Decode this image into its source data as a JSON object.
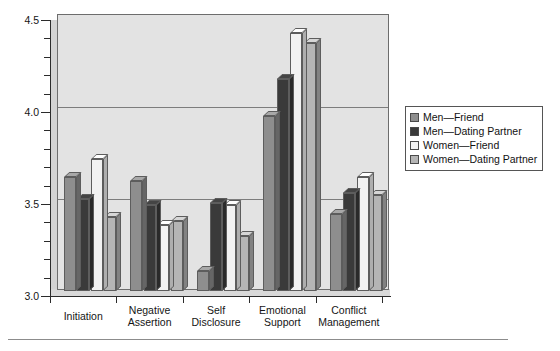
{
  "chart_data": {
    "type": "bar",
    "title": "",
    "subtitle": "",
    "xlabel": "",
    "ylabel": "",
    "ylim": [
      3.0,
      4.5
    ],
    "yticks": [
      "3.0",
      "3.5",
      "4.0",
      "4.5"
    ],
    "ytick_values": [
      3.0,
      3.5,
      4.0,
      4.5
    ],
    "minor_tick_step": 0.1,
    "grid": true,
    "gridlines_at": [
      3.5,
      4.0
    ],
    "legend_position": "right",
    "three_d": true,
    "categories": [
      "Initiation",
      "Negative Assertion",
      "Self Disclosure",
      "Emotional Support",
      "Conflict Management"
    ],
    "category_lines": [
      [
        "Initiation"
      ],
      [
        "Negative",
        "Assertion"
      ],
      [
        "Self",
        "Disclosure"
      ],
      [
        "Emotional",
        "Support"
      ],
      [
        "Conflict",
        "Management"
      ]
    ],
    "series": [
      {
        "name": "Men—Friend",
        "color": "#8e8e8e",
        "values": [
          3.62,
          3.6,
          3.11,
          3.95,
          3.42
        ]
      },
      {
        "name": "Men—Dating Partner",
        "color": "#3a3a3a",
        "values": [
          3.5,
          3.47,
          3.48,
          4.15,
          3.53
        ]
      },
      {
        "name": "Women—Friend",
        "color": "#f2f2f2",
        "values": [
          3.72,
          3.36,
          3.47,
          4.4,
          3.62
        ]
      },
      {
        "name": "Women—Dating Partner",
        "color": "#b5b5b5",
        "values": [
          3.4,
          3.38,
          3.3,
          4.35,
          3.52
        ]
      }
    ]
  },
  "legend": {
    "items": [
      {
        "label": "Men—Friend",
        "color": "#8e8e8e"
      },
      {
        "label": "Men—Dating Partner",
        "color": "#3a3a3a"
      },
      {
        "label": "Women—Friend",
        "color": "#f2f2f2"
      },
      {
        "label": "Women—Dating Partner",
        "color": "#b5b5b5"
      }
    ]
  },
  "colors": {
    "plot_background": "#e3e3e3",
    "plot_border": "#6d6d6d",
    "gridline": "#7d7d7d",
    "axis": "#2b2b2b",
    "text": "#151515"
  }
}
